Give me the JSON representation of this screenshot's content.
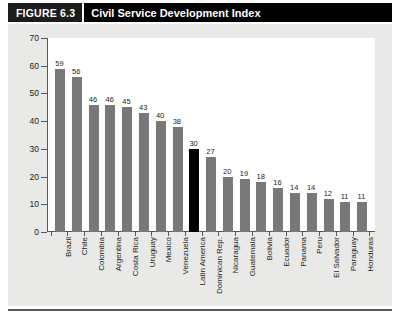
{
  "header": {
    "figure_number": "FIGURE 6.3",
    "title": "Civil Service Development Index"
  },
  "colors": {
    "header_background": "#000000",
    "figure_number_background": "#1c1c1c",
    "header_text": "#ffffff",
    "panel_background": "#e9e9e7",
    "plot_background": "#ffffff",
    "bar": "#787878",
    "bar_highlight": "#000000",
    "axis": "#58585a",
    "text": "#231f20"
  },
  "chart_data": {
    "type": "bar",
    "title": "Civil Service Development Index",
    "xlabel": "",
    "ylabel": "",
    "ylim": [
      0,
      70
    ],
    "yticks": [
      0,
      10,
      20,
      30,
      40,
      50,
      60,
      70
    ],
    "grid": false,
    "legend": null,
    "highlight_category": "Latin America",
    "categories": [
      "Brazil",
      "Chile",
      "Colombia",
      "Argentina",
      "Costa Rica",
      "Uruguay",
      "Mexico",
      "Venezuela",
      "Latin America",
      "Dominican Rep.",
      "Nicaragua",
      "Guatemala",
      "Bolivia",
      "Ecuador",
      "Panama",
      "Peru",
      "El Salvador",
      "Paraguay",
      "Honduras"
    ],
    "values": [
      59,
      56,
      46,
      46,
      45,
      43,
      40,
      38,
      30,
      27,
      20,
      19,
      18,
      16,
      14,
      14,
      12,
      11,
      11
    ]
  }
}
